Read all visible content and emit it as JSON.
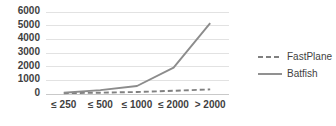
{
  "chart_data": {
    "type": "line",
    "title": "",
    "xlabel": "",
    "ylabel": "",
    "categories": [
      "≤ 250",
      "≤ 500",
      "≤ 1000",
      "≤ 2000",
      "> 2000"
    ],
    "ylim": [
      0,
      6000
    ],
    "yticks": [
      0,
      1000,
      2000,
      3000,
      4000,
      5000,
      6000
    ],
    "ytick_labels": [
      "0",
      "1000",
      "2000",
      "3000",
      "4000",
      "5000",
      "6000"
    ],
    "grid": "horizontal",
    "legend_position": "right",
    "series": [
      {
        "name": "FastPlane",
        "style": "dashed",
        "color": "#808080",
        "values": [
          20,
          60,
          110,
          200,
          300
        ]
      },
      {
        "name": "Batfish",
        "style": "solid",
        "color": "#8c8c8c",
        "values": [
          50,
          250,
          550,
          1900,
          5150
        ]
      }
    ]
  },
  "legend": {
    "items": [
      {
        "label": "FastPlane",
        "style": "dashed",
        "color": "#808080"
      },
      {
        "label": "Batfish",
        "style": "solid",
        "color": "#8c8c8c"
      }
    ]
  },
  "colors": {
    "background": "#ffffff",
    "gridline": "#e2e2e2",
    "axis": "#c9c9c9",
    "text": "#3f3f3f",
    "fastplane": "#808080",
    "batfish": "#8c8c8c"
  }
}
